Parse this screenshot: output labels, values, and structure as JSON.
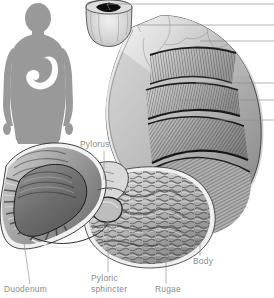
{
  "figure": {
    "background_color": "#ffffff",
    "ink_color": "#8b8b8b",
    "silhouette_color": "#909090",
    "organ_light": "#e9e9e9",
    "organ_mid": "#bdbdbd",
    "organ_dark": "#6f6f6f",
    "outline_color": "#222222"
  },
  "inset": {
    "name": "body-silhouette-inset",
    "description": "Gray human body silhouette with white stomach location highlight"
  },
  "labels": [
    {
      "id": "pylorus",
      "text": "Pylorus",
      "line1": "Pylorus",
      "line2": "",
      "x": 80,
      "y": 147
    },
    {
      "id": "duodenum",
      "text": "Duodenum",
      "line1": "Duodenum",
      "line2": "",
      "x": 4,
      "y": 292
    },
    {
      "id": "pyloric-sphincter",
      "text": "Pyloric sphincter",
      "line1": "Pyloric",
      "line2": "sphincter",
      "x": 91,
      "y": 281
    },
    {
      "id": "rugae",
      "text": "Rugae",
      "line1": "Rugae",
      "line2": "",
      "x": 155,
      "y": 292
    },
    {
      "id": "body",
      "text": "Body",
      "line1": "Body",
      "line2": "",
      "x": 193,
      "y": 264
    }
  ],
  "edge_leaders": [
    {
      "id": "edge-leader-1",
      "y": 4,
      "x_start": 107,
      "note": "esophagus / cardiac orifice"
    },
    {
      "id": "edge-leader-2",
      "y": 25,
      "x_start": 137,
      "note": "upper stomach region"
    },
    {
      "id": "edge-leader-3",
      "y": 41,
      "x_start": 200,
      "note": "fundus surface"
    },
    {
      "id": "edge-leader-4",
      "y": 83,
      "x_start": 196,
      "note": "longitudinal muscle layer"
    },
    {
      "id": "edge-leader-5",
      "y": 100,
      "x_start": 178,
      "note": "circular muscle layer"
    },
    {
      "id": "edge-leader-6",
      "y": 120,
      "x_start": 198,
      "note": "oblique muscle layer"
    }
  ],
  "structures": [
    {
      "id": "esophagus",
      "name": "Esophagus with stellate lumen opening"
    },
    {
      "id": "fundus",
      "name": "Fundus of stomach"
    },
    {
      "id": "muscle-band-upper",
      "name": "Longitudinal muscle layer band"
    },
    {
      "id": "muscle-band-middle",
      "name": "Circular muscle layer band"
    },
    {
      "id": "muscle-band-lower",
      "name": "Oblique muscle layer band"
    },
    {
      "id": "greater-curvature",
      "name": "Greater curvature"
    },
    {
      "id": "lesser-curvature",
      "name": "Lesser curvature"
    },
    {
      "id": "rugae-region",
      "name": "Rugae mucosal folds in cutaway interior"
    },
    {
      "id": "pyloric-region",
      "name": "Pyloric canal and sphincter"
    },
    {
      "id": "duodenum-cutaway",
      "name": "Duodenum cutaway with circular folds"
    }
  ]
}
